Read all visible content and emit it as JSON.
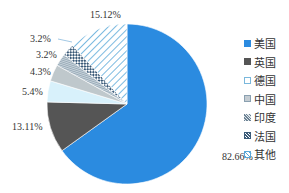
{
  "chart_data": {
    "type": "pie",
    "title": "",
    "start": "top",
    "direction": "clockwise",
    "legend_position": "right",
    "slices": [
      {
        "name": "美国",
        "value": 82.66,
        "label": "82.66%",
        "color": "#2b8be0",
        "pattern": "solid"
      },
      {
        "name": "英国",
        "value": 13.11,
        "label": "13.11%",
        "color": "#555555",
        "pattern": "solid"
      },
      {
        "name": "德国",
        "value": 5.4,
        "label": "5.4%",
        "color": "#d8f1fb",
        "pattern": "light"
      },
      {
        "name": "中国",
        "value": 4.3,
        "label": "4.3%",
        "color": "#bfc8cc",
        "pattern": "gray"
      },
      {
        "name": "印度",
        "value": 3.2,
        "label": "3.2%",
        "color": "#8aa0b0",
        "pattern": "vlines"
      },
      {
        "name": "法国",
        "value": 3.2,
        "label": "3.2%",
        "color": "#3a5a78",
        "pattern": "checker"
      },
      {
        "name": "其他",
        "value": 15.12,
        "label": "15.12%",
        "color": "#5aa8d8",
        "pattern": "diag"
      }
    ]
  }
}
